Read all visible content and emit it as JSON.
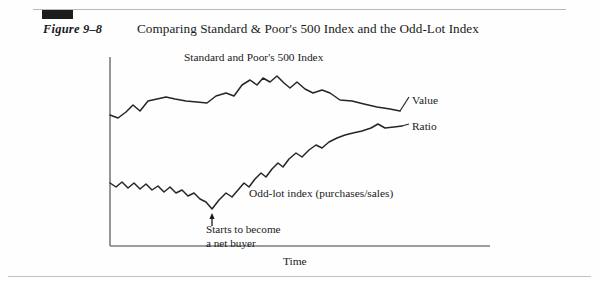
{
  "figure": {
    "label": "Figure 9–8",
    "title": "Comparing Standard & Poor's 500 Index and the Odd-Lot Index"
  },
  "chart_data": {
    "type": "line",
    "title": "Comparing Standard & Poor's 500 Index and the Odd-Lot Index",
    "xlabel": "Time",
    "ylabel": "",
    "grid": false,
    "legend_position": "right-inline",
    "annotations": [
      {
        "name": "series-label-sp500",
        "text": "Standard and Poor's 500 Index",
        "x": 184,
        "y": 51
      },
      {
        "name": "series-label-oddlot",
        "text": "Odd-lot index (purchases/sales)",
        "x": 249,
        "y": 187
      },
      {
        "name": "callout-net-buyer",
        "text": "Starts to become a net buyer",
        "line1": "Starts to become",
        "line2": "a net buyer",
        "arrow": "up-arrow",
        "x": 206,
        "y": 223
      }
    ],
    "series": [
      {
        "name": "Standard and Poor's 500 Index",
        "end_label": "Value",
        "color": "#252525",
        "points": [
          [
            110,
            115
          ],
          [
            118,
            118
          ],
          [
            126,
            112
          ],
          [
            133,
            105
          ],
          [
            140,
            111
          ],
          [
            148,
            101
          ],
          [
            157,
            99
          ],
          [
            166,
            97
          ],
          [
            175,
            99
          ],
          [
            186,
            101
          ],
          [
            197,
            102
          ],
          [
            207,
            103
          ],
          [
            216,
            96
          ],
          [
            226,
            93
          ],
          [
            234,
            96
          ],
          [
            242,
            85
          ],
          [
            250,
            80
          ],
          [
            257,
            85
          ],
          [
            263,
            78
          ],
          [
            270,
            82
          ],
          [
            277,
            76
          ],
          [
            284,
            83
          ],
          [
            290,
            88
          ],
          [
            297,
            82
          ],
          [
            305,
            89
          ],
          [
            313,
            93
          ],
          [
            322,
            90
          ],
          [
            330,
            93
          ],
          [
            340,
            100
          ],
          [
            352,
            101
          ],
          [
            364,
            104
          ],
          [
            377,
            107
          ],
          [
            390,
            109
          ],
          [
            400,
            111
          ]
        ]
      },
      {
        "name": "Odd-lot index (purchases/sales)",
        "end_label": "Ratio",
        "color": "#252525",
        "points": [
          [
            110,
            183
          ],
          [
            116,
            187
          ],
          [
            122,
            182
          ],
          [
            128,
            188
          ],
          [
            134,
            183
          ],
          [
            140,
            189
          ],
          [
            146,
            184
          ],
          [
            152,
            190
          ],
          [
            158,
            186
          ],
          [
            164,
            192
          ],
          [
            170,
            187
          ],
          [
            176,
            193
          ],
          [
            182,
            190
          ],
          [
            188,
            196
          ],
          [
            194,
            193
          ],
          [
            200,
            199
          ],
          [
            206,
            202
          ],
          [
            212,
            209
          ],
          [
            219,
            200
          ],
          [
            226,
            193
          ],
          [
            232,
            197
          ],
          [
            238,
            190
          ],
          [
            244,
            183
          ],
          [
            249,
            187
          ],
          [
            255,
            179
          ],
          [
            261,
            173
          ],
          [
            266,
            177
          ],
          [
            272,
            169
          ],
          [
            278,
            163
          ],
          [
            283,
            167
          ],
          [
            289,
            159
          ],
          [
            296,
            153
          ],
          [
            302,
            157
          ],
          [
            309,
            150
          ],
          [
            316,
            145
          ],
          [
            322,
            148
          ],
          [
            329,
            142
          ],
          [
            337,
            138
          ],
          [
            345,
            135
          ],
          [
            353,
            133
          ],
          [
            362,
            131
          ],
          [
            371,
            128
          ],
          [
            378,
            124
          ],
          [
            385,
            128
          ],
          [
            394,
            127
          ],
          [
            402,
            126
          ]
        ]
      }
    ],
    "axes": {
      "y_axis": {
        "x": 110,
        "y_top": 57,
        "y_bottom": 246
      },
      "x_axis": {
        "y": 246,
        "x_left": 110,
        "x_right": 490
      },
      "color": "#7d7d7d"
    },
    "leader_lines": [
      {
        "name": "leader-value",
        "from": [
          400,
          111
        ],
        "to": [
          409,
          97
        ]
      },
      {
        "name": "leader-ratio",
        "from": [
          402,
          126
        ],
        "to": [
          409,
          124
        ]
      }
    ],
    "arrow_marker": {
      "x": 212,
      "y_from": 226,
      "y_to": 213
    }
  },
  "labels": {
    "value": "Value",
    "ratio": "Ratio",
    "sp500": "Standard and Poor's 500 Index",
    "oddlot": "Odd-lot index (purchases/sales)",
    "time": "Time",
    "note_line1": "Starts to become",
    "note_line2": "a net buyer"
  }
}
